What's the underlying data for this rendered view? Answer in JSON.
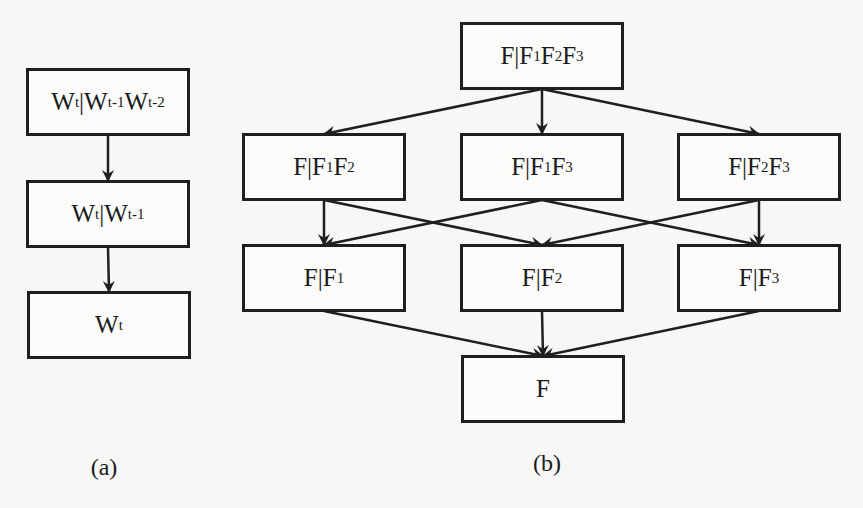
{
  "diagram_a": {
    "caption": "(a)",
    "nodes": [
      {
        "id": "a1",
        "base": "W",
        "parts": [
          {
            "t": "W"
          },
          {
            "s": "t"
          },
          {
            "t": "|W"
          },
          {
            "s": "t-1"
          },
          {
            "t": "W"
          },
          {
            "s": "t-2"
          }
        ],
        "label": "Wt|Wt-1Wt-2",
        "x": 26,
        "y": 68,
        "w": 164,
        "h": 68
      },
      {
        "id": "a2",
        "parts": [
          {
            "t": "W"
          },
          {
            "s": "t"
          },
          {
            "t": "|W"
          },
          {
            "s": "t-1"
          }
        ],
        "label": "Wt|Wt-1",
        "x": 26,
        "y": 180,
        "w": 164,
        "h": 68
      },
      {
        "id": "a3",
        "parts": [
          {
            "t": "W"
          },
          {
            "s": "t"
          }
        ],
        "label": "Wt",
        "x": 27,
        "y": 291,
        "w": 164,
        "h": 68
      }
    ],
    "edges": [
      [
        "a1",
        "a2"
      ],
      [
        "a2",
        "a3"
      ]
    ]
  },
  "diagram_b": {
    "caption": "(b)",
    "nodes": [
      {
        "id": "b0",
        "parts": [
          {
            "t": "F|F"
          },
          {
            "s": "1"
          },
          {
            "t": "F"
          },
          {
            "s": "2"
          },
          {
            "t": "F"
          },
          {
            "s": "3"
          }
        ],
        "label": "F|F1F2F3",
        "x": 460,
        "y": 22,
        "w": 164,
        "h": 68
      },
      {
        "id": "b12",
        "parts": [
          {
            "t": "F|F"
          },
          {
            "s": "1"
          },
          {
            "t": "F"
          },
          {
            "s": "2"
          }
        ],
        "label": "F|F1F2",
        "x": 242,
        "y": 133,
        "w": 164,
        "h": 68
      },
      {
        "id": "b13",
        "parts": [
          {
            "t": "F|F"
          },
          {
            "s": "1"
          },
          {
            "t": "F"
          },
          {
            "s": "3"
          }
        ],
        "label": "F|F1F3",
        "x": 460,
        "y": 133,
        "w": 164,
        "h": 68
      },
      {
        "id": "b23",
        "parts": [
          {
            "t": "F|F"
          },
          {
            "s": "2"
          },
          {
            "t": "F"
          },
          {
            "s": "3"
          }
        ],
        "label": "F|F2F3",
        "x": 677,
        "y": 133,
        "w": 164,
        "h": 68
      },
      {
        "id": "b1",
        "parts": [
          {
            "t": "F|F"
          },
          {
            "s": "1"
          }
        ],
        "label": "F|F1",
        "x": 242,
        "y": 244,
        "w": 164,
        "h": 68
      },
      {
        "id": "b2",
        "parts": [
          {
            "t": "F|F"
          },
          {
            "s": "2"
          }
        ],
        "label": "F|F2",
        "x": 460,
        "y": 244,
        "w": 164,
        "h": 68
      },
      {
        "id": "b3",
        "parts": [
          {
            "t": "F|F"
          },
          {
            "s": "3"
          }
        ],
        "label": "F|F3",
        "x": 677,
        "y": 244,
        "w": 164,
        "h": 68
      },
      {
        "id": "bF",
        "parts": [
          {
            "t": "F"
          }
        ],
        "label": "F",
        "x": 461,
        "y": 355,
        "w": 164,
        "h": 68
      }
    ],
    "edges": [
      [
        "b0",
        "b12"
      ],
      [
        "b0",
        "b13"
      ],
      [
        "b0",
        "b23"
      ],
      [
        "b12",
        "b1"
      ],
      [
        "b12",
        "b2"
      ],
      [
        "b13",
        "b1"
      ],
      [
        "b13",
        "b3"
      ],
      [
        "b23",
        "b2"
      ],
      [
        "b23",
        "b3"
      ],
      [
        "b1",
        "bF"
      ],
      [
        "b2",
        "bF"
      ],
      [
        "b3",
        "bF"
      ]
    ]
  },
  "captions": {
    "a": {
      "text": "(a)",
      "x": 104,
      "y": 454
    },
    "b": {
      "text": "(b)",
      "x": 547,
      "y": 450
    }
  },
  "colors": {
    "stroke": "#1f1f1f",
    "background": "#f7f7f5"
  }
}
